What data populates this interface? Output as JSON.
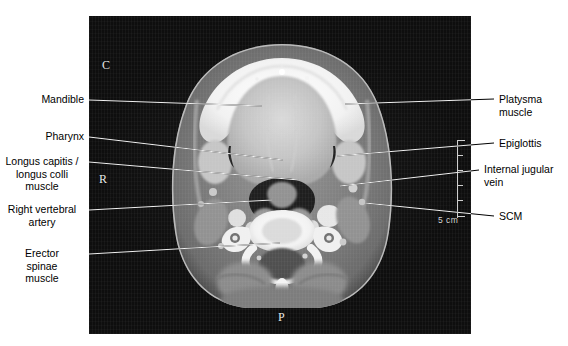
{
  "figure": {
    "modality_caption": "Axial CT of the neck with anatomical annotations",
    "panel": {
      "background_color": "#0e0e0e"
    },
    "orientation_markers": [
      {
        "name": "cranial-anterior-marker",
        "text": "C",
        "x": 102,
        "y": 58
      },
      {
        "name": "right-marker",
        "text": "R",
        "x": 99,
        "y": 172
      },
      {
        "name": "posterior-marker",
        "text": "P",
        "x": 278,
        "y": 310
      }
    ],
    "scale_bar": {
      "label": "5  cm",
      "value": 5,
      "unit": "cm",
      "tick_count": 5,
      "color": "#cfcfcf"
    },
    "labels_left": [
      {
        "name": "label-mandible",
        "text": "Mandible",
        "text_x": 38,
        "text_y": 93,
        "leader": {
          "x1": 89,
          "y1": 100,
          "x2": 262,
          "y2": 106
        }
      },
      {
        "name": "label-pharynx",
        "text": "Pharynx",
        "text_x": 40,
        "text_y": 130,
        "leader": {
          "x1": 89,
          "y1": 137,
          "x2": 283,
          "y2": 160
        }
      },
      {
        "name": "label-longus-capitis-colli-muscle",
        "text": "Longus capitis /\nlongus colli\nmuscle",
        "text_x": 10,
        "text_y": 155,
        "leader": {
          "x1": 89,
          "y1": 162,
          "x2": 299,
          "y2": 180
        }
      },
      {
        "name": "label-right-vertebral-artery",
        "text": "Right vertebral\nartery",
        "text_x": 13,
        "text_y": 203,
        "leader": {
          "x1": 89,
          "y1": 210,
          "x2": 272,
          "y2": 200
        }
      },
      {
        "name": "label-erector-spinae-muscle",
        "text": "Erector\nspinae\nmuscle",
        "text_x": 36,
        "text_y": 247,
        "leader": {
          "x1": 89,
          "y1": 254,
          "x2": 280,
          "y2": 243
        }
      }
    ],
    "labels_right": [
      {
        "name": "label-platysma-muscle",
        "text": "Platysma\nmuscle",
        "text_x": 499,
        "text_y": 93,
        "leader": {
          "x1": 345,
          "y1": 104,
          "x2": 494,
          "y2": 99
        }
      },
      {
        "name": "label-epiglottis",
        "text": "Epiglottis",
        "text_x": 499,
        "text_y": 137,
        "leader": {
          "x1": 337,
          "y1": 156,
          "x2": 494,
          "y2": 143
        }
      },
      {
        "name": "label-internal-jugular-vein",
        "text": "Internal jugular\nvein",
        "text_x": 484,
        "text_y": 163,
        "leader": {
          "x1": 340,
          "y1": 186,
          "x2": 479,
          "y2": 170
        }
      },
      {
        "name": "label-scm",
        "text": "SCM",
        "text_x": 499,
        "text_y": 210,
        "leader": {
          "x1": 365,
          "y1": 203,
          "x2": 494,
          "y2": 216
        }
      }
    ]
  }
}
